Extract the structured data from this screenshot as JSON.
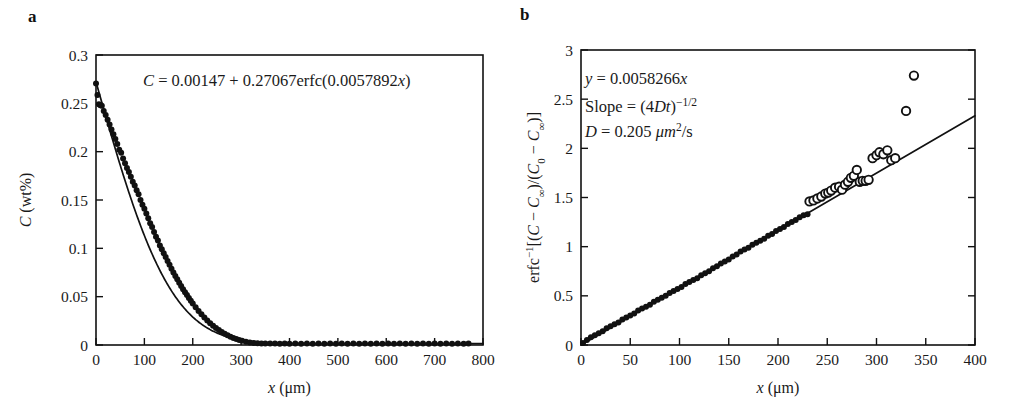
{
  "figure": {
    "background": "#ffffff",
    "ink_color": "#111111"
  },
  "panels": [
    {
      "letter": "a",
      "annotation": "C = 0.00147 + 0.27067erfc(0.0057892x)",
      "annotation_parts": {
        "lhs": "C",
        "eq": " = ",
        "intercept": "0.00147",
        "plus": " + ",
        "amplitude": "0.27067",
        "func": "erfc(",
        "rate": "0.0057892",
        "var": "x",
        "close": ")"
      }
    },
    {
      "letter": "b",
      "annotation_lines": [
        "y = 0.0058266x",
        "Slope = (4Dt)−1/2",
        "D = 0.205 μm2/s"
      ],
      "annotation_parts": {
        "y_var": "y",
        "y_eq": " = ",
        "y_slope": "0.0058266",
        "y_x": "x",
        "slope_label": "Slope",
        "slope_eq": " = ",
        "slope_open": "(4",
        "slope_D": "D",
        "slope_t": "t",
        "slope_close": ")",
        "slope_exp": "−1/2",
        "D_var": "D",
        "D_eq": " = ",
        "D_value": "0.205",
        "D_unit_mu": "μm",
        "D_unit_exp": "2",
        "D_unit_per": "/s"
      }
    }
  ],
  "chart_data": [
    {
      "type": "scatter",
      "panel": "a",
      "title": "",
      "xlabel": "x (μm)",
      "xlabel_parts": {
        "var": "x",
        "unit": "(μm)"
      },
      "ylabel": "C (wt%)",
      "ylabel_parts": {
        "var": "C",
        "unit": "(wt%)"
      },
      "xlim": [
        0,
        800
      ],
      "ylim": [
        0,
        0.3
      ],
      "xticks": [
        0,
        100,
        200,
        300,
        400,
        500,
        600,
        700,
        800
      ],
      "xticklabels": [
        "0",
        "100",
        "200",
        "300",
        "400",
        "500",
        "600",
        "700",
        "800"
      ],
      "yticks": [
        0,
        0.05,
        0.1,
        0.15,
        0.2,
        0.25,
        0.3
      ],
      "yticklabels": [
        "0",
        "0.05",
        "0.1",
        "0.15",
        "0.2",
        "0.25",
        "0.3"
      ],
      "grid": false,
      "legend": "none",
      "marker": "filled-circle",
      "fit_equation": "C = 0.00147 + 0.27067erfc(0.0057892x)",
      "fit_params": {
        "C_inf": 0.00147,
        "C0_minus_Cinf": 0.27067,
        "k": 0.0057892
      },
      "x": [
        0,
        3,
        6,
        9,
        12,
        16,
        20,
        24,
        28,
        32,
        36,
        40,
        44,
        48,
        52,
        56,
        60,
        64,
        68,
        72,
        76,
        80,
        84,
        88,
        92,
        96,
        100,
        104,
        108,
        112,
        116,
        120,
        124,
        128,
        132,
        136,
        140,
        144,
        148,
        152,
        156,
        160,
        164,
        168,
        172,
        176,
        180,
        184,
        188,
        192,
        196,
        200,
        206,
        212,
        218,
        224,
        230,
        236,
        242,
        248,
        254,
        260,
        266,
        272,
        278,
        284,
        290,
        296,
        302,
        310,
        318,
        326,
        334,
        342,
        350,
        360,
        370,
        380,
        390,
        400,
        412,
        424,
        436,
        448,
        460,
        472,
        484,
        496,
        508,
        520,
        532,
        544,
        556,
        568,
        580,
        592,
        604,
        616,
        628,
        640,
        652,
        664,
        676,
        688,
        700,
        712,
        724,
        736,
        748,
        760,
        770
      ],
      "y": [
        0.2705,
        0.2585,
        0.249,
        0.248,
        0.2475,
        0.242,
        0.238,
        0.233,
        0.228,
        0.223,
        0.218,
        0.213,
        0.208,
        0.202,
        0.199,
        0.193,
        0.188,
        0.183,
        0.179,
        0.174,
        0.169,
        0.165,
        0.16,
        0.156,
        0.15,
        0.145,
        0.141,
        0.136,
        0.131,
        0.126,
        0.122,
        0.117,
        0.112,
        0.108,
        0.103,
        0.099,
        0.095,
        0.091,
        0.087,
        0.083,
        0.079,
        0.075,
        0.0715,
        0.068,
        0.0645,
        0.061,
        0.0578,
        0.0546,
        0.0516,
        0.0486,
        0.0458,
        0.043,
        0.039,
        0.0352,
        0.0318,
        0.0285,
        0.0254,
        0.0226,
        0.02,
        0.0176,
        0.0154,
        0.0134,
        0.0116,
        0.01,
        0.0086,
        0.0073,
        0.0062,
        0.0052,
        0.0044,
        0.0034,
        0.0027,
        0.0021,
        0.0018,
        0.0016,
        0.0015,
        0.0015,
        0.0015,
        0.0014,
        0.0015,
        0.0014,
        0.0015,
        0.0014,
        0.0015,
        0.0014,
        0.0015,
        0.0014,
        0.0015,
        0.0014,
        0.0015,
        0.0014,
        0.0015,
        0.0014,
        0.0015,
        0.0014,
        0.0015,
        0.0014,
        0.0015,
        0.0014,
        0.0015,
        0.0014,
        0.0015,
        0.0014,
        0.0015,
        0.0014,
        0.0015,
        0.0014,
        0.0015,
        0.0014,
        0.0015,
        0.0014,
        0.0015,
        0.0014,
        0.0015
      ]
    },
    {
      "type": "scatter",
      "panel": "b",
      "title": "",
      "xlabel": "x (μm)",
      "xlabel_parts": {
        "var": "x",
        "unit": "(μm)"
      },
      "ylabel": "erfc−1[(C − C∞)/(C0 − C∞)]",
      "xlim": [
        0,
        400
      ],
      "ylim": [
        0,
        3
      ],
      "xticks": [
        0,
        50,
        100,
        150,
        200,
        250,
        300,
        350,
        400
      ],
      "xticklabels": [
        "0",
        "50",
        "100",
        "150",
        "200",
        "250",
        "300",
        "350",
        "400"
      ],
      "yticks": [
        0,
        0.5,
        1,
        1.5,
        2,
        2.5,
        3
      ],
      "yticklabels": [
        "0",
        "0.5",
        "1",
        "1.5",
        "2",
        "2.5",
        "3"
      ],
      "grid": false,
      "legend": "none",
      "fit_line": {
        "slope": 0.0058266,
        "intercept": 0,
        "x_from": 0,
        "x_to": 400
      },
      "series": [
        {
          "name": "filled",
          "marker": "filled-circle",
          "x": [
            2,
            6,
            10,
            14,
            18,
            22,
            26,
            30,
            34,
            38,
            42,
            46,
            50,
            54,
            58,
            62,
            66,
            70,
            74,
            78,
            82,
            86,
            90,
            94,
            98,
            102,
            106,
            110,
            114,
            118,
            122,
            126,
            130,
            134,
            138,
            142,
            146,
            150,
            154,
            158,
            162,
            166,
            170,
            174,
            178,
            182,
            186,
            190,
            194,
            198,
            202,
            206,
            210,
            214,
            218,
            222,
            226,
            230
          ],
          "y": [
            0.02,
            0.05,
            0.08,
            0.1,
            0.12,
            0.14,
            0.17,
            0.19,
            0.21,
            0.23,
            0.26,
            0.28,
            0.3,
            0.32,
            0.35,
            0.37,
            0.39,
            0.41,
            0.44,
            0.46,
            0.48,
            0.5,
            0.53,
            0.55,
            0.57,
            0.59,
            0.62,
            0.64,
            0.66,
            0.68,
            0.71,
            0.73,
            0.75,
            0.78,
            0.8,
            0.83,
            0.85,
            0.87,
            0.9,
            0.92,
            0.95,
            0.97,
            0.99,
            1.02,
            1.04,
            1.06,
            1.08,
            1.11,
            1.13,
            1.16,
            1.18,
            1.2,
            1.23,
            1.25,
            1.27,
            1.3,
            1.32,
            1.33
          ]
        },
        {
          "name": "open",
          "marker": "open-circle",
          "x": [
            232,
            236,
            240,
            244,
            248,
            251,
            254,
            258,
            262,
            265,
            268,
            271,
            274,
            277,
            280,
            283,
            286,
            289,
            292,
            296,
            300,
            303,
            307,
            311,
            315,
            319,
            330,
            338
          ],
          "y": [
            1.46,
            1.47,
            1.49,
            1.51,
            1.54,
            1.55,
            1.57,
            1.6,
            1.61,
            1.58,
            1.63,
            1.66,
            1.7,
            1.72,
            1.78,
            1.66,
            1.67,
            1.67,
            1.68,
            1.9,
            1.93,
            1.96,
            1.94,
            1.98,
            1.88,
            1.9,
            2.38,
            2.74
          ]
        }
      ]
    }
  ]
}
